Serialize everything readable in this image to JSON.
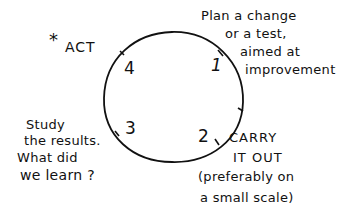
{
  "diagram": {
    "type": "cycle",
    "stroke_color": "#111111",
    "background": "#ffffff",
    "steps": [
      {
        "number": "1",
        "lines": [
          "Plan a change",
          "or a test,",
          "aimed at",
          "improvement"
        ]
      },
      {
        "number": "2",
        "lines": [
          "CARRY",
          "IT OUT",
          "(preferably on",
          "a small scale)"
        ]
      },
      {
        "number": "3",
        "lines": [
          "Study",
          "the results.",
          "What did",
          "we learn ?"
        ]
      },
      {
        "number": "4",
        "lines": [
          "ACT"
        ],
        "marker": "*"
      }
    ]
  }
}
